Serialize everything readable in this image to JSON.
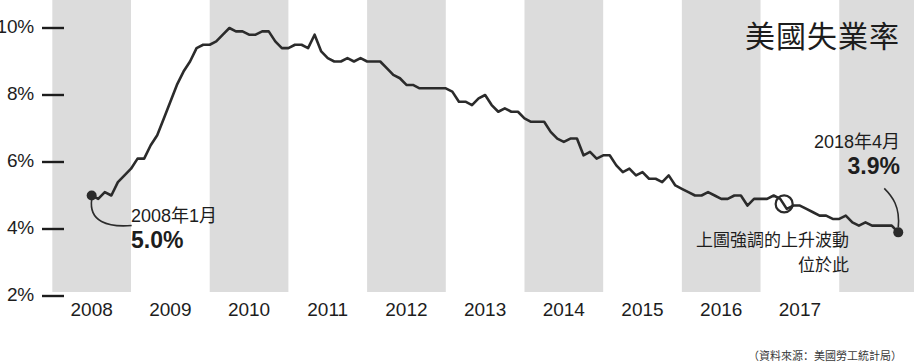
{
  "chart_data": {
    "type": "line",
    "title": "美國失業率",
    "xlabel": "",
    "ylabel": "",
    "ylim": [
      1.5,
      10.6
    ],
    "xlim": [
      2007.75,
      2018.45
    ],
    "grid": false,
    "legend": "none",
    "y_ticks": [
      "10%",
      "8%",
      "6%",
      "4%",
      "2%"
    ],
    "y_tick_values": [
      10,
      8,
      6,
      4,
      2
    ],
    "x_ticks": [
      "2008",
      "2009",
      "2010",
      "2011",
      "2012",
      "2013",
      "2014",
      "2015",
      "2016",
      "2017"
    ],
    "x_tick_values": [
      2008,
      2009,
      2010,
      2011,
      2012,
      2013,
      2014,
      2015,
      2016,
      2017
    ],
    "series_name": "美國失業率",
    "x": [
      2008.0,
      2008.083,
      2008.167,
      2008.25,
      2008.333,
      2008.417,
      2008.5,
      2008.583,
      2008.667,
      2008.75,
      2008.833,
      2008.917,
      2009.0,
      2009.083,
      2009.167,
      2009.25,
      2009.333,
      2009.417,
      2009.5,
      2009.583,
      2009.667,
      2009.75,
      2009.833,
      2009.917,
      2010.0,
      2010.083,
      2010.167,
      2010.25,
      2010.333,
      2010.417,
      2010.5,
      2010.583,
      2010.667,
      2010.75,
      2010.833,
      2010.917,
      2011.0,
      2011.083,
      2011.167,
      2011.25,
      2011.333,
      2011.417,
      2011.5,
      2011.583,
      2011.667,
      2011.75,
      2011.833,
      2011.917,
      2012.0,
      2012.083,
      2012.167,
      2012.25,
      2012.333,
      2012.417,
      2012.5,
      2012.583,
      2012.667,
      2012.75,
      2012.833,
      2012.917,
      2013.0,
      2013.083,
      2013.167,
      2013.25,
      2013.333,
      2013.417,
      2013.5,
      2013.583,
      2013.667,
      2013.75,
      2013.833,
      2013.917,
      2014.0,
      2014.083,
      2014.167,
      2014.25,
      2014.333,
      2014.417,
      2014.5,
      2014.583,
      2014.667,
      2014.75,
      2014.833,
      2014.917,
      2015.0,
      2015.083,
      2015.167,
      2015.25,
      2015.333,
      2015.417,
      2015.5,
      2015.583,
      2015.667,
      2015.75,
      2015.833,
      2015.917,
      2016.0,
      2016.083,
      2016.167,
      2016.25,
      2016.333,
      2016.417,
      2016.5,
      2016.583,
      2016.667,
      2016.75,
      2016.833,
      2016.917,
      2017.0,
      2017.083,
      2017.167,
      2017.25,
      2017.333,
      2017.417,
      2017.5,
      2017.583,
      2017.667,
      2017.75,
      2017.833,
      2017.917,
      2018.0,
      2018.083,
      2018.167,
      2018.25
    ],
    "values": [
      5.0,
      4.9,
      5.1,
      5.0,
      5.4,
      5.6,
      5.8,
      6.1,
      6.1,
      6.5,
      6.8,
      7.3,
      7.8,
      8.3,
      8.7,
      9.0,
      9.4,
      9.5,
      9.5,
      9.6,
      9.8,
      10.0,
      9.9,
      9.9,
      9.8,
      9.8,
      9.9,
      9.9,
      9.6,
      9.4,
      9.4,
      9.5,
      9.5,
      9.4,
      9.8,
      9.3,
      9.1,
      9.0,
      9.0,
      9.1,
      9.0,
      9.1,
      9.0,
      9.0,
      9.0,
      8.8,
      8.6,
      8.5,
      8.3,
      8.3,
      8.2,
      8.2,
      8.2,
      8.2,
      8.2,
      8.1,
      7.8,
      7.8,
      7.7,
      7.9,
      8.0,
      7.7,
      7.5,
      7.6,
      7.5,
      7.5,
      7.3,
      7.2,
      7.2,
      7.2,
      6.9,
      6.7,
      6.6,
      6.7,
      6.7,
      6.2,
      6.3,
      6.1,
      6.2,
      6.2,
      5.9,
      5.7,
      5.8,
      5.6,
      5.7,
      5.5,
      5.5,
      5.4,
      5.6,
      5.3,
      5.2,
      5.1,
      5.0,
      5.0,
      5.1,
      5.0,
      4.9,
      4.9,
      5.0,
      5.0,
      4.7,
      4.9,
      4.9,
      4.9,
      5.0,
      4.9,
      4.6,
      4.7,
      4.7,
      4.6,
      4.5,
      4.4,
      4.4,
      4.3,
      4.3,
      4.4,
      4.2,
      4.1,
      4.2,
      4.1,
      4.1,
      4.1,
      4.1,
      3.9
    ],
    "recession_bands_label": "交替年度灰色區塊",
    "annotations": [
      {
        "id": "start",
        "date": "2008年1月",
        "value": "5.0%",
        "x": 2008.0,
        "y": 5.0,
        "marker": "filled-dot"
      },
      {
        "id": "end",
        "date": "2018年4月",
        "value": "3.9%",
        "x": 2018.25,
        "y": 3.9,
        "marker": "filled-dot"
      },
      {
        "id": "highlight",
        "text_line1": "上圖強調的上升波動",
        "text_line2": "位於此",
        "x": 2016.8,
        "y": 4.75,
        "marker": "hollow-circle"
      }
    ]
  },
  "title": "美國失業率",
  "axis": {
    "y_labels": [
      "10%",
      "8%",
      "6%",
      "4%",
      "2%"
    ],
    "x_labels": [
      "2008",
      "2009",
      "2010",
      "2011",
      "2012",
      "2013",
      "2014",
      "2015",
      "2016",
      "2017"
    ]
  },
  "annotations": {
    "left": {
      "date": "2008年1月",
      "value": "5.0%"
    },
    "right": {
      "date": "2018年4月",
      "value": "3.9%"
    },
    "note_line1": "上圖強調的上升波動",
    "note_line2": "位於此"
  },
  "source": "（資料來源：美國勞工統計局）",
  "colors": {
    "line": "#2b2b2b",
    "band": "#dcdcdc",
    "text": "#1d1d1d",
    "background": "#ffffff"
  }
}
